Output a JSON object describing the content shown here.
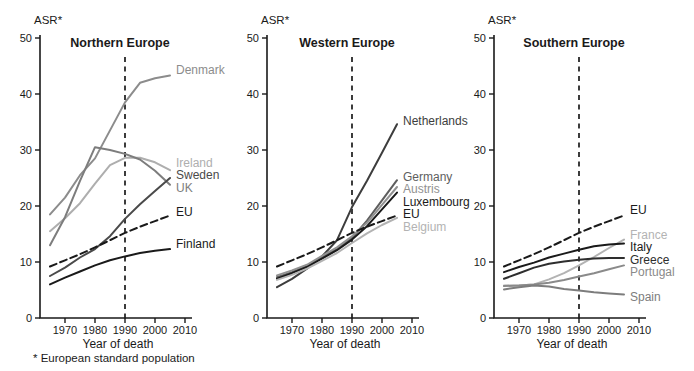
{
  "figure": {
    "y_axis_label": "ASR*",
    "x_axis_label": "Year of death",
    "footnote": "* European standard population",
    "axis_color": "#1a1a1a",
    "ylim": [
      0,
      50
    ],
    "yticks": [
      0,
      10,
      20,
      30,
      40,
      50
    ],
    "xticks": [
      1970,
      1980,
      1990,
      2000,
      2010
    ],
    "reference_year": 1990
  },
  "chart_data": [
    {
      "type": "line",
      "title": "Northern Europe",
      "xlabel": "Year of death",
      "ylabel": "ASR*",
      "ylim": [
        0,
        50
      ],
      "x": [
        1965,
        1970,
        1975,
        1980,
        1985,
        1990,
        1995,
        2000,
        2005
      ],
      "series": [
        {
          "name": "Denmark",
          "color": "#8c8c8c",
          "dashed": false,
          "label_asr": 44.2,
          "values": [
            18.5,
            21.5,
            25.5,
            28.5,
            33.5,
            38.5,
            42.0,
            42.8,
            43.3
          ]
        },
        {
          "name": "Ireland",
          "color": "#aeaeae",
          "dashed": false,
          "label_asr": 27.6,
          "values": [
            15.5,
            17.8,
            20.5,
            24.0,
            27.3,
            28.6,
            28.6,
            27.8,
            26.4
          ]
        },
        {
          "name": "UK",
          "color": "#7d7d7d",
          "dashed": false,
          "label_asr": 23.2,
          "values": [
            13.0,
            18.0,
            24.5,
            30.5,
            30.0,
            29.3,
            28.3,
            26.3,
            23.8
          ]
        },
        {
          "name": "Sweden",
          "color": "#4a4a4a",
          "dashed": false,
          "label_asr": 25.5,
          "values": [
            7.5,
            9.0,
            10.8,
            12.3,
            14.6,
            17.7,
            20.3,
            22.7,
            25.0
          ]
        },
        {
          "name": "EU",
          "color": "#1a1a1a",
          "dashed": true,
          "label_asr": 18.9,
          "values": [
            9.2,
            10.3,
            11.4,
            12.6,
            13.9,
            15.2,
            16.3,
            17.3,
            18.3
          ]
        },
        {
          "name": "Finland",
          "color": "#1a1a1a",
          "dashed": false,
          "label_asr": 13.2,
          "values": [
            6.0,
            7.2,
            8.3,
            9.4,
            10.3,
            11.0,
            11.6,
            12.0,
            12.3
          ]
        }
      ]
    },
    {
      "type": "line",
      "title": "Western Europe",
      "xlabel": "Year of death",
      "ylabel": "ASR*",
      "ylim": [
        0,
        50
      ],
      "x": [
        1965,
        1970,
        1975,
        1980,
        1985,
        1990,
        1995,
        2000,
        2005
      ],
      "series": [
        {
          "name": "Netherlands",
          "color": "#3d3d3d",
          "dashed": false,
          "label_asr": 35.2,
          "values": [
            5.5,
            7.0,
            8.8,
            11.0,
            13.9,
            19.8,
            24.5,
            29.5,
            34.6
          ]
        },
        {
          "name": "Germany",
          "color": "#5e5e5e",
          "dashed": false,
          "label_asr": 25.2,
          "values": [
            7.3,
            8.2,
            9.3,
            10.9,
            12.3,
            14.3,
            17.4,
            21.0,
            24.6
          ]
        },
        {
          "name": "Austris",
          "color": "#919191",
          "dashed": false,
          "label_asr": 23.0,
          "values": [
            7.6,
            8.5,
            9.5,
            11.1,
            12.6,
            14.6,
            17.0,
            20.2,
            23.4
          ]
        },
        {
          "name": "Luxembourg",
          "color": "#1a1a1a",
          "dashed": false,
          "label_asr": 20.8,
          "values": [
            7.0,
            8.0,
            9.1,
            10.6,
            12.1,
            14.0,
            16.4,
            19.4,
            22.4
          ]
        },
        {
          "name": "EU",
          "color": "#1a1a1a",
          "dashed": true,
          "label_asr": 18.6,
          "values": [
            9.2,
            10.3,
            11.4,
            12.6,
            13.9,
            15.2,
            16.3,
            17.3,
            18.3
          ]
        },
        {
          "name": "Belgium",
          "color": "#b3b3b3",
          "dashed": false,
          "label_asr": 16.3,
          "values": [
            6.8,
            7.7,
            8.8,
            10.2,
            11.6,
            13.4,
            15.1,
            16.6,
            17.9
          ]
        }
      ]
    },
    {
      "type": "line",
      "title": "Southern Europe",
      "xlabel": "Year of death",
      "ylabel": "ASR*",
      "ylim": [
        0,
        50
      ],
      "x": [
        1965,
        1970,
        1975,
        1980,
        1985,
        1990,
        1995,
        2000,
        2005
      ],
      "series": [
        {
          "name": "EU",
          "color": "#1a1a1a",
          "dashed": true,
          "label_asr": 19.2,
          "values": [
            9.2,
            10.3,
            11.4,
            12.6,
            13.9,
            15.2,
            16.3,
            17.3,
            18.3
          ]
        },
        {
          "name": "France",
          "color": "#b3b3b3",
          "dashed": false,
          "label_asr": 14.8,
          "values": [
            5.8,
            5.8,
            6.0,
            6.9,
            8.0,
            9.4,
            10.9,
            12.5,
            14.0
          ]
        },
        {
          "name": "Italy",
          "color": "#1a1a1a",
          "dashed": false,
          "label_asr": 12.6,
          "values": [
            8.2,
            9.1,
            9.9,
            10.8,
            11.5,
            12.2,
            12.8,
            13.1,
            13.3
          ]
        },
        {
          "name": "Greece",
          "color": "#2e2e2e",
          "dashed": false,
          "label_asr": 10.4,
          "values": [
            7.0,
            8.0,
            9.0,
            9.7,
            10.1,
            10.4,
            10.6,
            10.7,
            10.7
          ]
        },
        {
          "name": "Portugal",
          "color": "#8a8a8a",
          "dashed": false,
          "label_asr": 8.2,
          "values": [
            5.7,
            5.8,
            6.0,
            6.3,
            6.8,
            7.4,
            8.0,
            8.7,
            9.4
          ]
        },
        {
          "name": "Spain",
          "color": "#7d7d7d",
          "dashed": false,
          "label_asr": 3.8,
          "values": [
            5.1,
            5.5,
            5.8,
            5.6,
            5.2,
            4.9,
            4.6,
            4.4,
            4.2
          ]
        }
      ]
    }
  ]
}
